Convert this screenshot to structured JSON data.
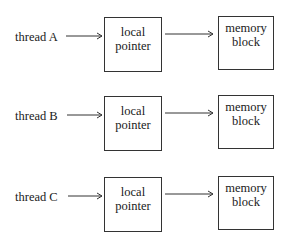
{
  "diagram": {
    "rows": [
      {
        "thread": "thread A",
        "pointer": [
          "local",
          "pointer"
        ],
        "block": [
          "memory",
          "block"
        ]
      },
      {
        "thread": "thread B",
        "pointer": [
          "local",
          "pointer"
        ],
        "block": [
          "memory",
          "block"
        ]
      },
      {
        "thread": "thread C",
        "pointer": [
          "local",
          "pointer"
        ],
        "block": [
          "memory",
          "block"
        ]
      }
    ]
  }
}
